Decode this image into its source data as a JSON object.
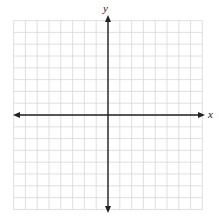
{
  "figure": {
    "type": "coordinate-plane",
    "x_axis_label": "x",
    "y_axis_label": "y",
    "grid": {
      "cells_left_of_y_axis": 8,
      "cells_right_of_y_axis": 8,
      "cells_above_x_axis": 8,
      "cells_below_x_axis": 8,
      "line_color": "#d8d8d8",
      "axis_color": "#222222"
    },
    "tick_labels": []
  }
}
